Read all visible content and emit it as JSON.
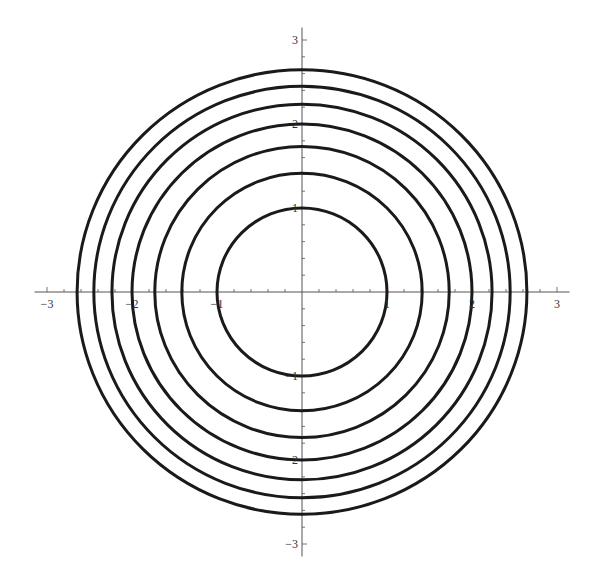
{
  "chart_data": {
    "type": "line",
    "title": "",
    "xlabel": "",
    "ylabel": "",
    "series": [
      {
        "name": "r=1",
        "radius": 1.0
      },
      {
        "name": "r=sqrt2",
        "radius": 1.414
      },
      {
        "name": "r=sqrt3",
        "radius": 1.732
      },
      {
        "name": "r=2",
        "radius": 2.0
      },
      {
        "name": "r=sqrt5",
        "radius": 2.236
      },
      {
        "name": "r=sqrt6",
        "radius": 2.449
      },
      {
        "name": "r=sqrt7",
        "radius": 2.646
      }
    ],
    "xlim": [
      -3.1,
      3.1
    ],
    "ylim": [
      -3.1,
      3.1
    ],
    "x_ticks": [
      "-3",
      "-2",
      "-1",
      "1",
      "2",
      "3"
    ],
    "y_ticks": [
      "-3",
      "-2",
      "-1",
      "1",
      "2",
      "3"
    ],
    "minor_tick_step": 0.2,
    "grid": false,
    "legend": "none",
    "line_color": "#1a1a1a",
    "axis_color": "#555555"
  }
}
